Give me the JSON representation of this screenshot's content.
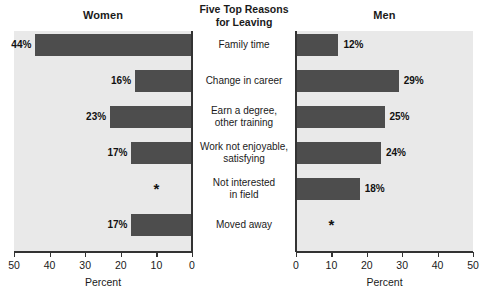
{
  "chart_data": {
    "type": "bar",
    "title": "Five Top Reasons for Leaving",
    "orientation": "horizontal",
    "layout": "back-to-back bidirectional bar chart (population pyramid style)",
    "categories": [
      "Family time",
      "Change in career",
      "Earn a degree, other training",
      "Work not enjoyable, satisfying",
      "Not interested in field",
      "Moved away"
    ],
    "category_lines": [
      [
        "Family time"
      ],
      [
        "Change in career"
      ],
      [
        "Earn a degree,",
        "other training"
      ],
      [
        "Work not enjoyable,",
        "satisfying"
      ],
      [
        "Not interested",
        "in field"
      ],
      [
        "Moved away"
      ]
    ],
    "series": [
      {
        "name": "Women",
        "values": [
          44,
          16,
          23,
          17,
          null,
          17
        ],
        "labels": [
          "44%",
          "16%",
          "23%",
          "17%",
          "*",
          "17%"
        ],
        "direction": "left",
        "axis_reversed": true
      },
      {
        "name": "Men",
        "values": [
          12,
          29,
          25,
          24,
          18,
          null
        ],
        "labels": [
          "12%",
          "29%",
          "25%",
          "24%",
          "18%",
          "*"
        ],
        "direction": "right",
        "axis_reversed": false
      }
    ],
    "xlabel": "Percent",
    "ylabel": "",
    "xlim": [
      0,
      50
    ],
    "ticks": [
      0,
      10,
      20,
      30,
      40,
      50
    ],
    "tick_labels_women": [
      "50",
      "40",
      "30",
      "20",
      "10",
      "0"
    ],
    "tick_labels_men": [
      "0",
      "10",
      "20",
      "30",
      "40",
      "50"
    ],
    "grid": false,
    "legend": "none",
    "suppressed_marker": "*",
    "colors": {
      "bar": "#4d4d4d",
      "plot_background": "#e9e9e9",
      "axis": "#333333",
      "text": "#1a1a1a",
      "page_background": "#ffffff"
    }
  },
  "panels": {
    "left": {
      "title": "Women",
      "xlabel": "Percent"
    },
    "center": {
      "title_line1": "Five Top Reasons",
      "title_line2": "for Leaving"
    },
    "right": {
      "title": "Men",
      "xlabel": "Percent"
    }
  }
}
